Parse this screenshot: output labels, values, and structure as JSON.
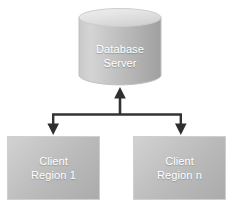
{
  "diagram": {
    "type": "architecture-diagram",
    "background_color": "#ffffff",
    "nodes": {
      "database_server": {
        "shape": "cylinder",
        "label_line1": "Database",
        "label_line2": "Server",
        "text_color": "#ffffff",
        "fill_light": "#d8d8d8",
        "fill_mid": "#bdbdbd",
        "fill_dark": "#a3a3a3",
        "outline_color": "#c2c2c2"
      },
      "client_region_1": {
        "shape": "rectangle",
        "label_line1": "Client",
        "label_line2": "Region 1",
        "text_color": "#ffffff",
        "fill_light": "#d2d2d2",
        "fill_dark": "#ababab",
        "border_color": "#cfcfcf"
      },
      "client_region_n": {
        "shape": "rectangle",
        "label_line1": "Client",
        "label_line2": "Region n",
        "text_color": "#ffffff",
        "fill_light": "#d2d2d2",
        "fill_dark": "#ababab",
        "border_color": "#cfcfcf"
      }
    },
    "connectors": {
      "color": "#333333",
      "edges": [
        {
          "from": "bus",
          "to": "database_server",
          "direction": "up"
        },
        {
          "from": "bus",
          "to": "client_region_1",
          "direction": "down"
        },
        {
          "from": "bus",
          "to": "client_region_n",
          "direction": "down"
        }
      ]
    }
  }
}
